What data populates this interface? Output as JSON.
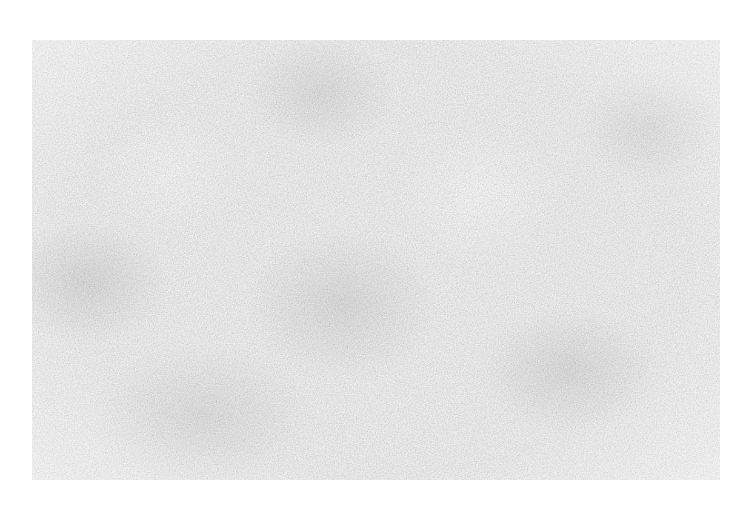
{
  "canvas": {
    "width": 747,
    "height": 511,
    "background_color": "#ffffff"
  },
  "texture": {
    "description": "grainy light-gray paper noise texture",
    "base_color": "#f4f4f4",
    "speckle_color": "#9a9a9a",
    "bounds": {
      "x": 32,
      "y": 40,
      "width": 688,
      "height": 440
    }
  }
}
